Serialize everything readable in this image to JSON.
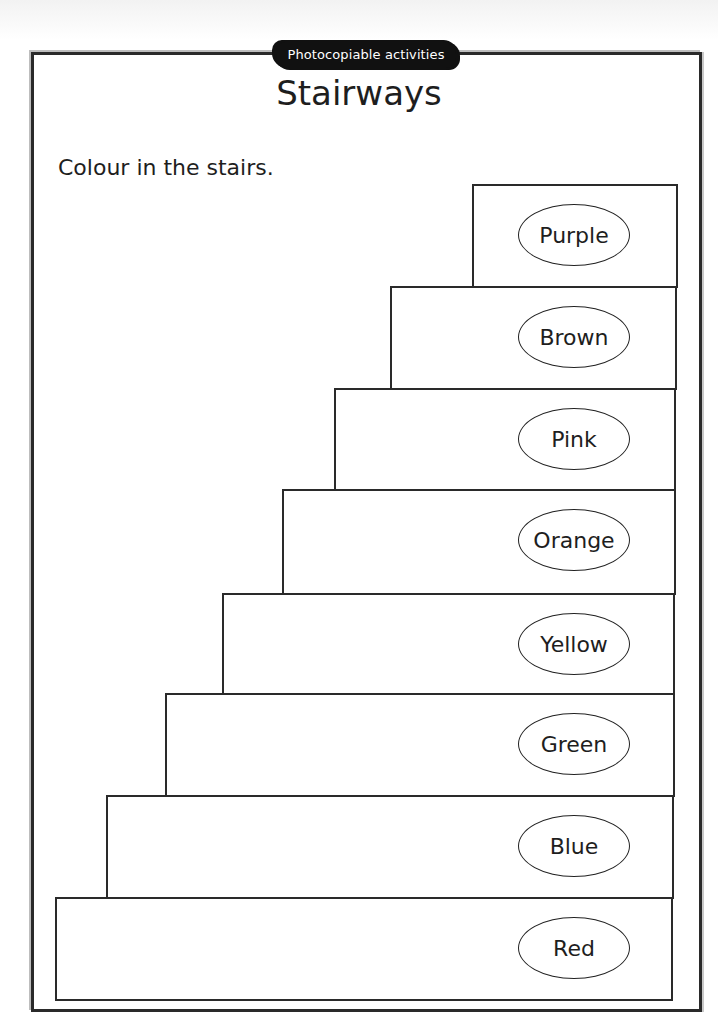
{
  "header": {
    "badge": "Photocopiable activities",
    "title": "Stairways"
  },
  "instruction": "Colour in the stairs.",
  "stairs": [
    {
      "label": "Purple",
      "left": 472,
      "top": 184,
      "right": 678,
      "bottom": 288
    },
    {
      "label": "Brown",
      "left": 390,
      "top": 286,
      "right": 677,
      "bottom": 390
    },
    {
      "label": "Pink",
      "left": 334,
      "top": 388,
      "right": 676,
      "bottom": 491
    },
    {
      "label": "Orange",
      "left": 282,
      "top": 489,
      "right": 676,
      "bottom": 595
    },
    {
      "label": "Yellow",
      "left": 222,
      "top": 593,
      "right": 675,
      "bottom": 695
    },
    {
      "label": "Green",
      "left": 165,
      "top": 693,
      "right": 675,
      "bottom": 797
    },
    {
      "label": "Blue",
      "left": 106,
      "top": 795,
      "right": 674,
      "bottom": 899
    },
    {
      "label": "Red",
      "left": 55,
      "top": 897,
      "right": 673,
      "bottom": 1001
    }
  ]
}
